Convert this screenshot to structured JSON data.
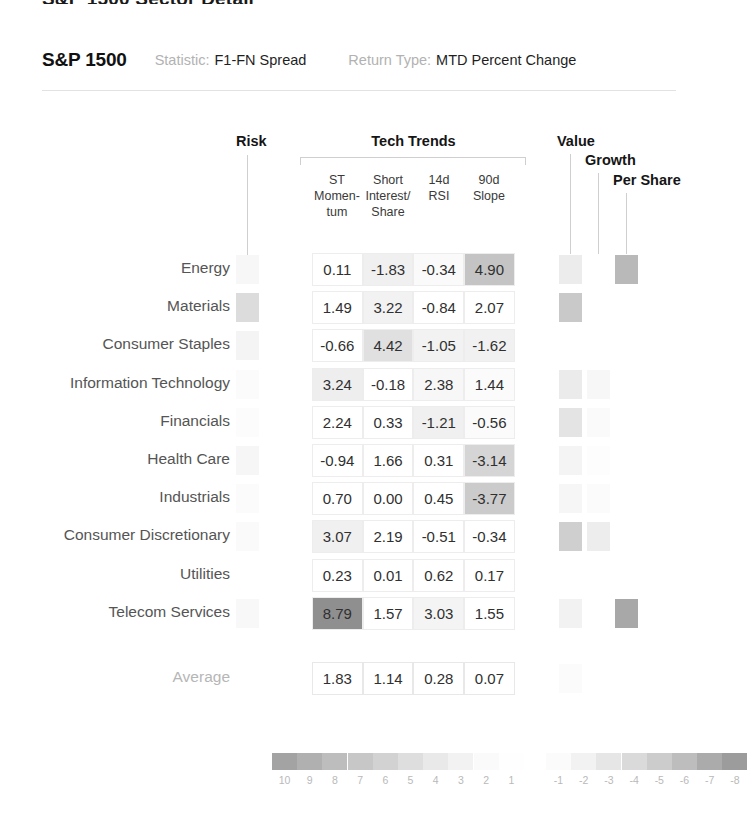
{
  "top_sliver_text": "S&P 1500 Sector Detail",
  "header": {
    "title": "S&P 1500",
    "statistic_label": "Statistic:",
    "statistic_value": "F1-FN Spread",
    "return_type_label": "Return Type:",
    "return_type_value": "MTD Percent Change"
  },
  "groups": {
    "risk": "Risk",
    "tech_trends": "Tech Trends",
    "value": "Value",
    "growth": "Growth",
    "per_share": "Per Share"
  },
  "columns": [
    "ST\nMomen-\ntum",
    "Short\nInterest/\nShare",
    "14d\nRSI",
    "90d\nSlope"
  ],
  "column_lines": [
    [
      "ST",
      "Momen-",
      "tum"
    ],
    [
      "Short",
      "Interest/",
      "Share"
    ],
    [
      "14d",
      "RSI",
      ""
    ],
    [
      "90d",
      "Slope",
      ""
    ]
  ],
  "average_label": "Average",
  "chart_data": {
    "type": "heatmap",
    "xlabel": "",
    "ylabel": "",
    "categories": [
      "ST Momentum",
      "Short Interest/Share",
      "14d RSI",
      "90d Slope"
    ],
    "rows": [
      {
        "label": "Energy",
        "risk_shade": "#f7f7f7",
        "values": [
          "0.11",
          "-1.83",
          "-0.34",
          "4.90"
        ],
        "shades": [
          "#ffffff",
          "#f0f0f0",
          "#fafafa",
          "#c4c4c4"
        ],
        "style": {
          "value": "#ececec",
          "growth": "#ffffff",
          "per_share": "#b9b9b9"
        }
      },
      {
        "label": "Materials",
        "risk_shade": "#dcdcdc",
        "values": [
          "1.49",
          "3.22",
          "-0.84",
          "2.07"
        ],
        "shades": [
          "#ffffff",
          "#f2f2f2",
          "#ffffff",
          "#ffffff"
        ],
        "style": {
          "value": "#c9c9c9",
          "growth": "#ffffff",
          "per_share": "#ffffff"
        }
      },
      {
        "label": "Consumer Staples",
        "risk_shade": "#f4f4f4",
        "values": [
          "-0.66",
          "4.42",
          "-1.05",
          "-1.62"
        ],
        "shades": [
          "#ffffff",
          "#e0e0e0",
          "#f2f2f2",
          "#f1f1f1"
        ],
        "style": {
          "value": "#ffffff",
          "growth": "#ffffff",
          "per_share": "#ffffff"
        }
      },
      {
        "label": "Information Technology",
        "risk_shade": "#fbfbfb",
        "values": [
          "3.24",
          "-0.18",
          "2.38",
          "1.44"
        ],
        "shades": [
          "#eeeeee",
          "#ffffff",
          "#f7f7f7",
          "#fbfbfb"
        ],
        "style": {
          "value": "#ebebeb",
          "growth": "#f7f7f7",
          "per_share": "#ffffff"
        }
      },
      {
        "label": "Financials",
        "risk_shade": "#fcfcfc",
        "values": [
          "2.24",
          "0.33",
          "-1.21",
          "-0.56"
        ],
        "shades": [
          "#ffffff",
          "#ffffff",
          "#f0f0f0",
          "#fbfbfb"
        ],
        "style": {
          "value": "#e4e4e4",
          "growth": "#fafafa",
          "per_share": "#ffffff"
        }
      },
      {
        "label": "Health Care",
        "risk_shade": "#f6f6f6",
        "values": [
          "-0.94",
          "1.66",
          "0.31",
          "-3.14"
        ],
        "shades": [
          "#ffffff",
          "#ffffff",
          "#ffffff",
          "#d5d5d5"
        ],
        "style": {
          "value": "#f4f4f4",
          "growth": "#fdfdfd",
          "per_share": "#ffffff"
        }
      },
      {
        "label": "Industrials",
        "risk_shade": "#fbfbfb",
        "values": [
          "0.70",
          "0.00",
          "0.45",
          "-3.77"
        ],
        "shades": [
          "#ffffff",
          "#ffffff",
          "#ffffff",
          "#cbcbcb"
        ],
        "style": {
          "value": "#f6f6f6",
          "growth": "#fbfbfb",
          "per_share": "#ffffff"
        }
      },
      {
        "label": "Consumer Discretionary",
        "risk_shade": "#fafafa",
        "values": [
          "3.07",
          "2.19",
          "-0.51",
          "-0.34"
        ],
        "shades": [
          "#f0f0f0",
          "#ffffff",
          "#ffffff",
          "#ffffff"
        ],
        "style": {
          "value": "#cfcfcf",
          "growth": "#ededed",
          "per_share": "#ffffff"
        }
      },
      {
        "label": "Utilities",
        "risk_shade": "#ffffff",
        "values": [
          "0.23",
          "0.01",
          "0.62",
          "0.17"
        ],
        "shades": [
          "#ffffff",
          "#ffffff",
          "#ffffff",
          "#ffffff"
        ],
        "style": {
          "value": "#ffffff",
          "growth": "#ffffff",
          "per_share": "#ffffff"
        }
      },
      {
        "label": "Telecom Services",
        "risk_shade": "#f8f8f8",
        "values": [
          "8.79",
          "1.57",
          "3.03",
          "1.55"
        ],
        "shades": [
          "#8f8f8f",
          "#ffffff",
          "#f4f4f4",
          "#ffffff"
        ],
        "style": {
          "value": "#f2f2f2",
          "growth": "#ffffff",
          "per_share": "#a8a8a8"
        }
      }
    ],
    "average_row": {
      "label": "Average",
      "values": [
        "1.83",
        "1.14",
        "0.28",
        "0.07"
      ],
      "style": {
        "value": "#fbfbfb",
        "growth": "#ffffff",
        "per_share": "#ffffff"
      }
    },
    "legend": {
      "labels": [
        "10",
        "9",
        "8",
        "7",
        "6",
        "5",
        "4",
        "3",
        "2",
        "1",
        "-1",
        "-2",
        "-3",
        "-4",
        "-5",
        "-6",
        "-7",
        "-8"
      ],
      "swatches": [
        "#a3a3a3",
        "#b0b0b0",
        "#bdbdbd",
        "#c7c7c7",
        "#d2d2d2",
        "#dedede",
        "#e9e9e9",
        "#f2f2f2",
        "#fafafa",
        "#fefefe",
        "#fbfbfb",
        "#f2f2f2",
        "#e6e6e6",
        "#dadada",
        "#cccccc",
        "#bdbdbd",
        "#ababab",
        "#9c9c9c"
      ]
    }
  }
}
